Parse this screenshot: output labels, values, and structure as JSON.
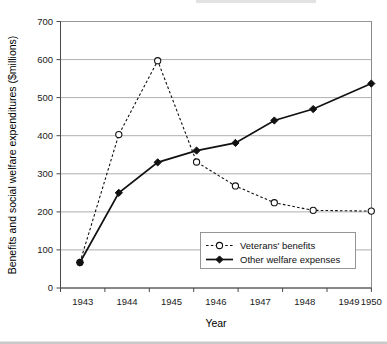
{
  "chart_data": {
    "type": "line",
    "title": "",
    "xlabel": "Year",
    "ylabel": "Benefits and social welfare expenditures ($millions)",
    "categories": [
      "1943",
      "1944",
      "1945",
      "1946",
      "1947",
      "1948",
      "1949",
      "1950"
    ],
    "ylim": [
      0,
      700
    ],
    "yticks": [
      0,
      100,
      200,
      300,
      400,
      500,
      600,
      700
    ],
    "ytick_labels": [
      "0",
      "100",
      "200",
      "300",
      "400",
      "500",
      "600",
      "700"
    ],
    "grid": true,
    "grid_axis": "y",
    "legend_position": "inside lower right",
    "series": [
      {
        "name": "Veterans' benefits",
        "values": [
          67,
          403,
          597,
          331,
          268,
          224,
          204,
          202
        ],
        "line_style": "dashed",
        "marker": "open-circle",
        "color": "#111111"
      },
      {
        "name": "Other welfare expenses",
        "values": [
          67,
          250,
          330,
          361,
          381,
          440,
          470,
          537
        ],
        "line_style": "solid",
        "marker": "filled-diamond",
        "color": "#111111"
      }
    ]
  },
  "axes": {
    "y_title": "Benefits and social welfare expenditures ($millions)",
    "x_title": "Year",
    "y_tick_0": "0",
    "y_tick_1": "100",
    "y_tick_2": "200",
    "y_tick_3": "300",
    "y_tick_4": "400",
    "y_tick_5": "500",
    "y_tick_6": "600",
    "y_tick_7": "700",
    "x_tick_0": "1943",
    "x_tick_1": "1944",
    "x_tick_2": "1945",
    "x_tick_3": "1946",
    "x_tick_4": "1947",
    "x_tick_5": "1948",
    "x_tick_6": "1949",
    "x_tick_7": "1950"
  },
  "legend": {
    "entry_0_label": "Veterans' benefits",
    "entry_1_label": "Other welfare expenses"
  },
  "colors": {
    "series_line": "#111111",
    "gridline": "#9a9a9a",
    "plot_border": "#8a8a8a",
    "background": "#ffffff",
    "text": "#000000"
  }
}
